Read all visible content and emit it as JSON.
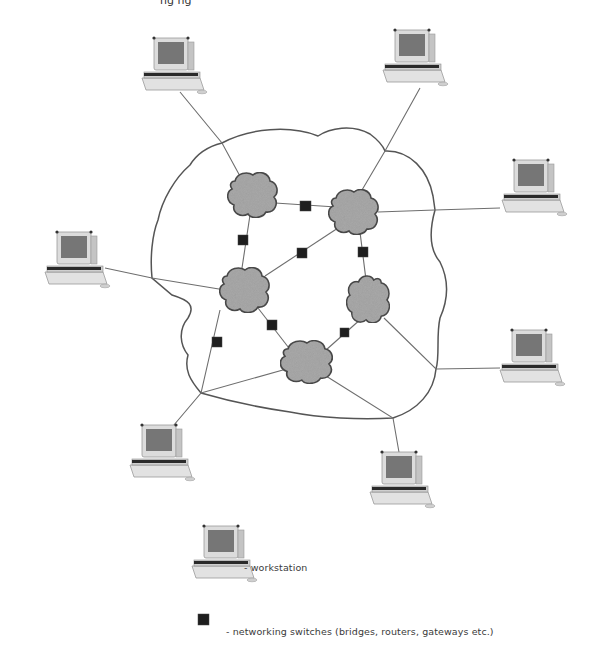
{
  "diagram": {
    "type": "network-topology",
    "top_text_fragment": "ng ng",
    "colors": {
      "background": "#ffffff",
      "line": "#6e6e6e",
      "boundary": "#555555",
      "cloud_fill": "#a9a9a9",
      "cloud_stroke": "#4a4a4a",
      "switch": "#1e1e1e",
      "monitor_screen": "#7a7a7a",
      "monitor_case": "#dcdcdc"
    },
    "clouds": [
      {
        "id": "net-a",
        "x": 253,
        "y": 195
      },
      {
        "id": "net-b",
        "x": 354,
        "y": 212
      },
      {
        "id": "net-c",
        "x": 245,
        "y": 290
      },
      {
        "id": "net-d",
        "x": 368,
        "y": 300
      },
      {
        "id": "net-e",
        "x": 307,
        "y": 362
      }
    ],
    "switches": [
      {
        "id": "sw-ab",
        "x": 306,
        "y": 206
      },
      {
        "id": "sw-ac",
        "x": 243,
        "y": 240
      },
      {
        "id": "sw-cb",
        "x": 302,
        "y": 253
      },
      {
        "id": "sw-bd",
        "x": 363,
        "y": 252
      },
      {
        "id": "sw-ce",
        "x": 272,
        "y": 325
      },
      {
        "id": "sw-c-bl",
        "x": 217,
        "y": 342
      },
      {
        "id": "sw-de",
        "x": 345,
        "y": 333
      }
    ],
    "workstations": [
      {
        "id": "ws-top-left",
        "x": 172,
        "y": 68
      },
      {
        "id": "ws-top-right",
        "x": 413,
        "y": 60
      },
      {
        "id": "ws-right",
        "x": 532,
        "y": 190
      },
      {
        "id": "ws-left",
        "x": 75,
        "y": 262
      },
      {
        "id": "ws-right-lower",
        "x": 530,
        "y": 360
      },
      {
        "id": "ws-bottom-left",
        "x": 160,
        "y": 455
      },
      {
        "id": "ws-bottom-right",
        "x": 400,
        "y": 482
      }
    ],
    "legend": {
      "workstation_label": "- workstation",
      "switch_label": "- networking switches (bridges, routers, gateways etc.)"
    }
  }
}
